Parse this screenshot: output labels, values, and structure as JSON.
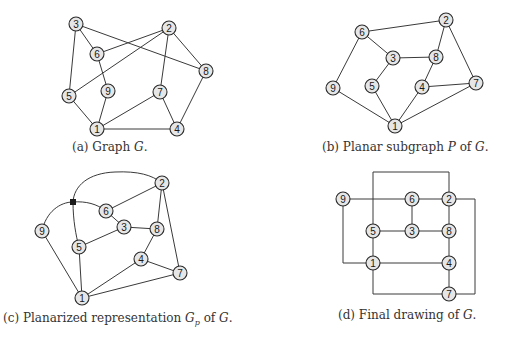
{
  "figure": {
    "subfigures": [
      {
        "id": "a",
        "caption_prefix": "(a) Graph ",
        "caption_var": "G",
        "caption_suffix": ".",
        "nodes": [
          {
            "id": "1",
            "x": 97,
            "y": 129
          },
          {
            "id": "2",
            "x": 169,
            "y": 28
          },
          {
            "id": "3",
            "x": 76,
            "y": 24
          },
          {
            "id": "4",
            "x": 177,
            "y": 129
          },
          {
            "id": "5",
            "x": 69,
            "y": 96
          },
          {
            "id": "6",
            "x": 97,
            "y": 54
          },
          {
            "id": "7",
            "x": 160,
            "y": 92
          },
          {
            "id": "8",
            "x": 206,
            "y": 71
          },
          {
            "id": "9",
            "x": 108,
            "y": 91
          }
        ],
        "edges": [
          [
            "3",
            "6"
          ],
          [
            "3",
            "5"
          ],
          [
            "3",
            "8"
          ],
          [
            "6",
            "2"
          ],
          [
            "6",
            "9"
          ],
          [
            "2",
            "5"
          ],
          [
            "2",
            "7"
          ],
          [
            "2",
            "8"
          ],
          [
            "9",
            "1"
          ],
          [
            "5",
            "1"
          ],
          [
            "1",
            "7"
          ],
          [
            "1",
            "4"
          ],
          [
            "7",
            "4"
          ],
          [
            "8",
            "4"
          ]
        ]
      },
      {
        "id": "b",
        "caption_prefix": "(b) Planar subgraph ",
        "caption_var": "P",
        "caption_mid": " of ",
        "caption_var2": "G",
        "caption_suffix": ".",
        "nodes": [
          {
            "id": "1",
            "x": 395,
            "y": 126
          },
          {
            "id": "2",
            "x": 446,
            "y": 20
          },
          {
            "id": "3",
            "x": 393,
            "y": 58
          },
          {
            "id": "4",
            "x": 422,
            "y": 87
          },
          {
            "id": "5",
            "x": 372,
            "y": 86
          },
          {
            "id": "6",
            "x": 362,
            "y": 32
          },
          {
            "id": "7",
            "x": 476,
            "y": 83
          },
          {
            "id": "8",
            "x": 436,
            "y": 57
          },
          {
            "id": "9",
            "x": 333,
            "y": 88
          }
        ],
        "edges": [
          [
            "6",
            "2"
          ],
          [
            "6",
            "3"
          ],
          [
            "6",
            "9"
          ],
          [
            "3",
            "8"
          ],
          [
            "3",
            "5"
          ],
          [
            "2",
            "8"
          ],
          [
            "2",
            "7"
          ],
          [
            "8",
            "4"
          ],
          [
            "4",
            "7"
          ],
          [
            "4",
            "1"
          ],
          [
            "5",
            "1"
          ],
          [
            "9",
            "1"
          ],
          [
            "7",
            "1"
          ]
        ]
      },
      {
        "id": "c",
        "caption_prefix": "(c) Planarized representation ",
        "caption_var": "G",
        "caption_sub": "p",
        "caption_mid": " of ",
        "caption_var2": "G",
        "caption_suffix": ".",
        "nodes": [
          {
            "id": "1",
            "x": 82,
            "y": 298
          },
          {
            "id": "2",
            "x": 162,
            "y": 183
          },
          {
            "id": "3",
            "x": 124,
            "y": 227
          },
          {
            "id": "4",
            "x": 141,
            "y": 259
          },
          {
            "id": "5",
            "x": 79,
            "y": 247
          },
          {
            "id": "6",
            "x": 106,
            "y": 211
          },
          {
            "id": "7",
            "x": 180,
            "y": 273
          },
          {
            "id": "8",
            "x": 157,
            "y": 229
          },
          {
            "id": "9",
            "x": 42,
            "y": 231
          }
        ],
        "dummy": {
          "x": 73,
          "y": 202
        },
        "edges": [
          [
            "6",
            "2"
          ],
          [
            "6",
            "3"
          ],
          [
            "3",
            "5"
          ],
          [
            "3",
            "8"
          ],
          [
            "2",
            "8"
          ],
          [
            "2",
            "7"
          ],
          [
            "8",
            "4"
          ],
          [
            "4",
            "7"
          ],
          [
            "4",
            "1"
          ],
          [
            "5",
            "1"
          ],
          [
            "9",
            "1"
          ],
          [
            "1",
            "7"
          ]
        ]
      },
      {
        "id": "d",
        "caption_prefix": "(d) Final drawing of ",
        "caption_var": "G",
        "caption_suffix": ".",
        "nodes": [
          {
            "id": "1",
            "x": 373,
            "y": 263
          },
          {
            "id": "2",
            "x": 449,
            "y": 199
          },
          {
            "id": "3",
            "x": 412,
            "y": 231
          },
          {
            "id": "4",
            "x": 449,
            "y": 263
          },
          {
            "id": "5",
            "x": 373,
            "y": 231
          },
          {
            "id": "6",
            "x": 412,
            "y": 199
          },
          {
            "id": "7",
            "x": 449,
            "y": 294
          },
          {
            "id": "8",
            "x": 449,
            "y": 231
          },
          {
            "id": "9",
            "x": 343,
            "y": 199
          }
        ]
      }
    ]
  }
}
